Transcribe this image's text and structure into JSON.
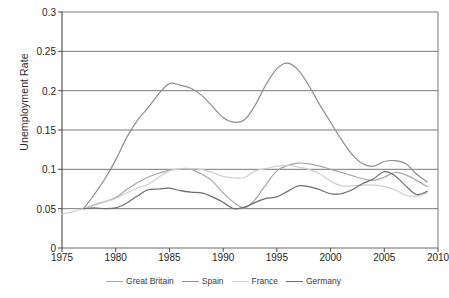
{
  "chart_data": {
    "type": "line",
    "title": "",
    "xlabel": "",
    "ylabel": "Unemployment Rate",
    "xlim": [
      1975,
      2010
    ],
    "ylim": [
      0,
      0.3
    ],
    "grid": true,
    "legend_position": "bottom",
    "xticks": [
      "1975",
      "1980",
      "1985",
      "1990",
      "1995",
      "2000",
      "2005",
      "2010"
    ],
    "xtick_values": [
      1975,
      1980,
      1985,
      1990,
      1995,
      2000,
      2005,
      2010
    ],
    "yticks": [
      "0",
      "0.05",
      "0.1",
      "0.15",
      "0.2",
      "0.25",
      "0.3"
    ],
    "ytick_values": [
      0,
      0.05,
      0.1,
      0.15,
      0.2,
      0.25,
      0.3
    ],
    "series": [
      {
        "name": "Great Britain",
        "color": "#a8a8a8",
        "x": [
          1977,
          1978,
          1979,
          1980,
          1981,
          1982,
          1983,
          1984,
          1985,
          1986,
          1987,
          1988,
          1989,
          1990,
          1991,
          1992,
          1993,
          1994,
          1995,
          1996,
          1997,
          1998,
          1999,
          2000,
          2001,
          2002,
          2003,
          2004,
          2005,
          2006,
          2007,
          2008,
          2009
        ],
        "values": [
          0.05,
          0.055,
          0.059,
          0.064,
          0.074,
          0.083,
          0.09,
          0.095,
          0.099,
          0.1,
          0.1,
          0.094,
          0.085,
          0.07,
          0.058,
          0.051,
          0.062,
          0.081,
          0.098,
          0.105,
          0.108,
          0.107,
          0.104,
          0.1,
          0.096,
          0.092,
          0.088,
          0.086,
          0.09,
          0.096,
          0.093,
          0.086,
          0.078
        ]
      },
      {
        "name": "Spain",
        "color": "#8f8f8f",
        "x": [
          1977,
          1978,
          1979,
          1980,
          1981,
          1982,
          1983,
          1984,
          1985,
          1986,
          1987,
          1988,
          1989,
          1990,
          1991,
          1992,
          1993,
          1994,
          1995,
          1996,
          1997,
          1998,
          1999,
          2000,
          2001,
          2002,
          2003,
          2004,
          2005,
          2006,
          2007,
          2008,
          2009
        ],
        "values": [
          0.05,
          0.068,
          0.088,
          0.112,
          0.14,
          0.162,
          0.178,
          0.196,
          0.209,
          0.207,
          0.203,
          0.194,
          0.18,
          0.166,
          0.16,
          0.163,
          0.182,
          0.208,
          0.228,
          0.235,
          0.226,
          0.206,
          0.182,
          0.16,
          0.138,
          0.119,
          0.107,
          0.104,
          0.11,
          0.111,
          0.107,
          0.094,
          0.084
        ]
      },
      {
        "name": "France",
        "color": "#cfcfcf",
        "x": [
          1975,
          1976,
          1977,
          1978,
          1979,
          1980,
          1981,
          1982,
          1983,
          1984,
          1985,
          1986,
          1987,
          1988,
          1989,
          1990,
          1991,
          1992,
          1993,
          1994,
          1995,
          1996,
          1997,
          1998,
          1999,
          2000,
          2001,
          2002,
          2003,
          2004,
          2005,
          2006,
          2007,
          2008,
          2009
        ],
        "values": [
          0.043,
          0.046,
          0.05,
          0.054,
          0.059,
          0.063,
          0.07,
          0.076,
          0.081,
          0.09,
          0.098,
          0.101,
          0.101,
          0.1,
          0.096,
          0.091,
          0.089,
          0.09,
          0.098,
          0.101,
          0.104,
          0.105,
          0.103,
          0.1,
          0.094,
          0.085,
          0.079,
          0.079,
          0.08,
          0.08,
          0.078,
          0.074,
          0.067,
          0.066,
          0.07
        ]
      },
      {
        "name": "Germany",
        "color": "#6e6e6e",
        "x": [
          1977,
          1978,
          1979,
          1980,
          1981,
          1982,
          1983,
          1984,
          1985,
          1986,
          1987,
          1988,
          1989,
          1990,
          1991,
          1992,
          1993,
          1994,
          1995,
          1996,
          1997,
          1998,
          1999,
          2000,
          2001,
          2002,
          2003,
          2004,
          2005,
          2006,
          2007,
          2008,
          2009
        ],
        "values": [
          0.05,
          0.051,
          0.05,
          0.051,
          0.057,
          0.066,
          0.074,
          0.075,
          0.076,
          0.073,
          0.071,
          0.07,
          0.065,
          0.058,
          0.05,
          0.052,
          0.058,
          0.063,
          0.065,
          0.072,
          0.079,
          0.078,
          0.074,
          0.069,
          0.069,
          0.074,
          0.082,
          0.088,
          0.097,
          0.092,
          0.079,
          0.068,
          0.072
        ]
      }
    ]
  },
  "legend": {
    "items": [
      {
        "label": "Great Britain",
        "color": "#a8a8a8"
      },
      {
        "label": "Spain",
        "color": "#8f8f8f"
      },
      {
        "label": "France",
        "color": "#cfcfcf"
      },
      {
        "label": "Germany",
        "color": "#6e6e6e"
      }
    ]
  }
}
